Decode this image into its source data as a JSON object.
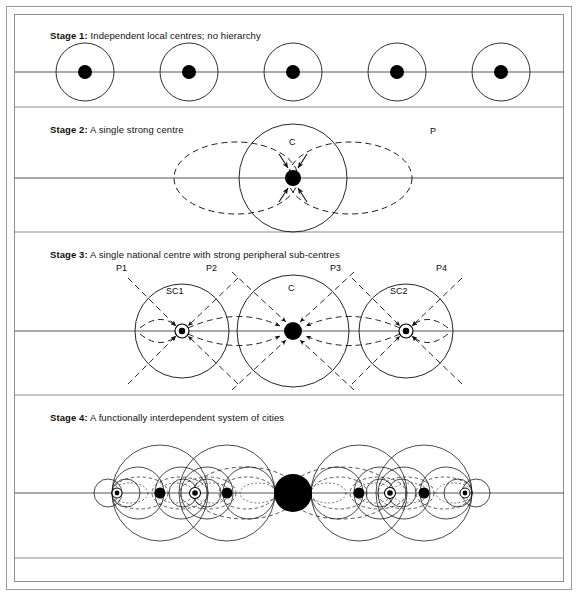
{
  "figure": {
    "kind": "diagram",
    "background_color": "#ffffff",
    "line_color": "#1a1a1a",
    "node_color": "#000000",
    "frame_color": "#9a9a9a",
    "axis_color": "#555555"
  },
  "stages": [
    {
      "id": "stage-1",
      "number_label": "Stage 1:",
      "title": "Independent local centres; no hierarchy",
      "label_text": "Stage 1: Independent local centres; no hierarchy",
      "centre_count": 5,
      "annotations": []
    },
    {
      "id": "stage-2",
      "number_label": "Stage 2:",
      "title": "A single strong centre",
      "label_text": "Stage 2: A single strong centre",
      "centre_count": 1,
      "annotations": [
        "C",
        "P"
      ]
    },
    {
      "id": "stage-3",
      "number_label": "Stage 3:",
      "title": "A single national centre with strong peripheral sub-centres",
      "label_text": "Stage 3: A single national centre with strong peripheral sub-centres",
      "centre_count": 3,
      "annotations": [
        "P1",
        "SC1",
        "P2",
        "C",
        "P3",
        "SC2",
        "P4"
      ]
    },
    {
      "id": "stage-4",
      "number_label": "Stage 4:",
      "title": "A functionally interdependent system of cities",
      "label_text": "Stage 4: A functionally interdependent system of cities",
      "centre_count": 9,
      "annotations": []
    }
  ],
  "labels": {
    "stage1_full": "Stage 1: Independent local centres; no hierarchy",
    "stage2_full": "Stage 2: A single strong centre",
    "stage3_full": "Stage 3: A single national centre with strong peripheral sub-centres",
    "stage4_full": "Stage 4: A functionally interdependent system of cities",
    "stage1_bold": "Stage 1:",
    "stage1_rest": " Independent local centres; no hierarchy",
    "stage2_bold": "Stage 2:",
    "stage2_rest": " A single strong centre",
    "stage3_bold": "Stage 3:",
    "stage3_rest": " A single national centre with strong peripheral sub-centres",
    "stage4_bold": "Stage 4:",
    "stage4_rest": " A functionally interdependent system of cities",
    "c": "C",
    "p": "P",
    "p1": "P1",
    "p2": "P2",
    "p3": "P3",
    "p4": "P4",
    "sc1": "SC1",
    "sc2": "SC2"
  },
  "stage1_centres": [
    {
      "cx": 85,
      "cy": 72,
      "r": 29,
      "node_r": 7
    },
    {
      "cx": 189,
      "cy": 72,
      "r": 29,
      "node_r": 7
    },
    {
      "cx": 293,
      "cy": 72,
      "r": 29,
      "node_r": 7
    },
    {
      "cx": 397,
      "cy": 72,
      "r": 29,
      "node_r": 7
    },
    {
      "cx": 501,
      "cy": 72,
      "r": 29,
      "node_r": 7
    }
  ],
  "stage2": {
    "axis_y": 178,
    "centre": {
      "cx": 293,
      "cy": 178,
      "node_r": 8
    },
    "solid_circle_r": 54,
    "lobe_rx": 62,
    "lobe_ry": 35,
    "lobe_offsets": [
      -57,
      57
    ],
    "label_c": {
      "x": 289,
      "y": 142
    },
    "label_p": {
      "x": 430,
      "y": 130
    }
  },
  "stage3": {
    "axis_y": 331,
    "centres": [
      {
        "id": "sc1",
        "cx": 182,
        "cy": 331,
        "r": 47,
        "node_r": 5,
        "node_type": "ring",
        "label": "SC1",
        "label_x": 168,
        "label_y": 290
      },
      {
        "id": "c",
        "cx": 293,
        "cy": 331,
        "r": 56,
        "node_r": 8,
        "node_type": "solid",
        "label": "C",
        "label_x": 289,
        "label_y": 287
      },
      {
        "id": "sc2",
        "cx": 406,
        "cy": 331,
        "r": 47,
        "node_r": 5,
        "node_type": "ring",
        "label": "SC2",
        "label_x": 392,
        "label_y": 290
      }
    ],
    "p_labels": [
      {
        "text": "P1",
        "x": 122,
        "y": 268
      },
      {
        "text": "P2",
        "x": 212,
        "y": 268
      },
      {
        "text": "P3",
        "x": 336,
        "y": 268
      },
      {
        "text": "P4",
        "x": 440,
        "y": 268
      }
    ]
  },
  "stage4": {
    "axis_y": 493,
    "national_centre": {
      "cx": 293,
      "cy": 493,
      "r": 18
    },
    "regional_centres": [
      {
        "cx": 160,
        "cy": 493,
        "r": 5.5
      },
      {
        "cx": 227,
        "cy": 493,
        "r": 5.5
      },
      {
        "cx": 359,
        "cy": 493,
        "r": 5.5
      },
      {
        "cx": 424,
        "cy": 493,
        "r": 5.5
      }
    ],
    "sub_centres": [
      {
        "cx": 117,
        "cy": 493,
        "r": 3
      },
      {
        "cx": 195,
        "cy": 493,
        "r": 3.5
      },
      {
        "cx": 390,
        "cy": 493,
        "r": 3.5
      },
      {
        "cx": 465,
        "cy": 493,
        "r": 3
      }
    ]
  },
  "separators": {
    "y_values": [
      107,
      232,
      395,
      558
    ],
    "x_start": 15,
    "x_end": 564
  }
}
